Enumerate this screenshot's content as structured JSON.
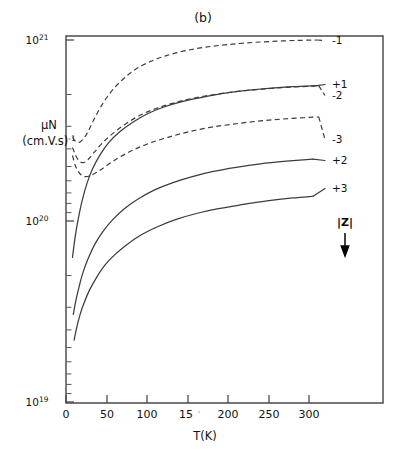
{
  "figure": {
    "panel_label": "(b)",
    "background_color": "#ffffff",
    "ink_color": "#3c3c3c"
  },
  "chart_data": {
    "type": "line",
    "title": "(b)",
    "xlabel": "T(K)",
    "ylabel": "μN (cm.V.s)⁻¹",
    "ylabel_line1": "μN",
    "ylabel_line2_base": "(cm.V.s)",
    "ylabel_line2_sup": "-1",
    "xlim": [
      0,
      350
    ],
    "ylim": [
      1e+19,
      1e+21
    ],
    "yscale": "log",
    "xscale": "linear",
    "grid": false,
    "legend_position": "right-inline",
    "xticks": [
      0,
      50,
      100,
      150,
      200,
      250,
      300
    ],
    "xtick_labels": [
      "0",
      "50",
      "100",
      "15",
      "200",
      "250",
      "300"
    ],
    "xtick_label_note": "the 150 tick label is degraded in the scan and reads as 15",
    "yticks": [
      1e+19,
      1e+20,
      1e+21
    ],
    "ytick_labels": [
      "10",
      "10",
      "10"
    ],
    "ytick_exponents": [
      "19",
      "20",
      "21"
    ],
    "annotations": [
      {
        "text": "|Z|",
        "meaning": "charge-state magnitude increases downward"
      }
    ],
    "series": [
      {
        "name": "-1",
        "label": "-1",
        "style": "dashed",
        "label_x": 332,
        "label_y": 44,
        "points": [
          [
            8,
            2.9e+20
          ],
          [
            12,
            2.75e+20
          ],
          [
            16,
            2.72e+20
          ],
          [
            20,
            2.8e+20
          ],
          [
            26,
            3.05e+20
          ],
          [
            34,
            3.6e+20
          ],
          [
            44,
            4.35e+20
          ],
          [
            56,
            5.2e+20
          ],
          [
            70,
            6.05e+20
          ],
          [
            86,
            6.9e+20
          ],
          [
            104,
            7.6e+20
          ],
          [
            124,
            8.2e+20
          ],
          [
            146,
            8.7e+20
          ],
          [
            170,
            9.1e+20
          ],
          [
            196,
            9.4e+20
          ],
          [
            224,
            9.65e+20
          ],
          [
            254,
            9.82e+20
          ],
          [
            286,
            9.95e+20
          ],
          [
            310,
            1e+21
          ]
        ]
      },
      {
        "name": "-2",
        "label": "-2",
        "style": "dashed",
        "label_x": 332,
        "label_y": 99,
        "points": [
          [
            8,
            2.55e+20
          ],
          [
            12,
            2.3e+20
          ],
          [
            16,
            2.15e+20
          ],
          [
            21,
            2.1e+20
          ],
          [
            27,
            2.18e+20
          ],
          [
            35,
            2.4e+20
          ],
          [
            45,
            2.7e+20
          ],
          [
            58,
            3.05e+20
          ],
          [
            74,
            3.45e+20
          ],
          [
            92,
            3.85e+20
          ],
          [
            112,
            4.2e+20
          ],
          [
            134,
            4.5e+20
          ],
          [
            158,
            4.78e+20
          ],
          [
            184,
            5e+20
          ],
          [
            212,
            5.2e+20
          ],
          [
            242,
            5.35e+20
          ],
          [
            272,
            5.48e+20
          ],
          [
            300,
            5.55e+20
          ],
          [
            312,
            5.6e+20
          ]
        ]
      },
      {
        "name": "-3",
        "label": "-3",
        "style": "dashed",
        "label_x": 332,
        "label_y": 143,
        "points": [
          [
            8,
            2.3e+20
          ],
          [
            12,
            2e+20
          ],
          [
            17,
            1.83e+20
          ],
          [
            23,
            1.76e+20
          ],
          [
            30,
            1.78e+20
          ],
          [
            40,
            1.88e+20
          ],
          [
            52,
            2.05e+20
          ],
          [
            66,
            2.25e+20
          ],
          [
            84,
            2.48e+20
          ],
          [
            104,
            2.7e+20
          ],
          [
            126,
            2.9e+20
          ],
          [
            150,
            3.1e+20
          ],
          [
            176,
            3.28e+20
          ],
          [
            204,
            3.42e+20
          ],
          [
            234,
            3.55e+20
          ],
          [
            264,
            3.65e+20
          ],
          [
            294,
            3.72e+20
          ],
          [
            312,
            3.76e+20
          ]
        ]
      },
      {
        "name": "+1",
        "label": "+1",
        "style": "solid",
        "label_x": 332,
        "label_y": 88,
        "points": [
          [
            8,
            6.3e+19
          ],
          [
            11,
            8e+19
          ],
          [
            15,
            1.02e+20
          ],
          [
            20,
            1.3e+20
          ],
          [
            26,
            1.62e+20
          ],
          [
            33,
            1.95e+20
          ],
          [
            42,
            2.32e+20
          ],
          [
            53,
            2.72e+20
          ],
          [
            66,
            3.1e+20
          ],
          [
            82,
            3.5e+20
          ],
          [
            100,
            3.9e+20
          ],
          [
            120,
            4.25e+20
          ],
          [
            142,
            4.55e+20
          ],
          [
            166,
            4.8e+20
          ],
          [
            192,
            5.05e+20
          ],
          [
            220,
            5.25e+20
          ],
          [
            250,
            5.4e+20
          ],
          [
            280,
            5.52e+20
          ],
          [
            310,
            5.6e+20
          ]
        ]
      },
      {
        "name": "+2",
        "label": "+2",
        "style": "solid",
        "label_x": 332,
        "label_y": 164,
        "points": [
          [
            9,
            3.05e+19
          ],
          [
            12,
            3.6e+19
          ],
          [
            16,
            4.3e+19
          ],
          [
            21,
            5.2e+19
          ],
          [
            28,
            6.3e+19
          ],
          [
            36,
            7.5e+19
          ],
          [
            46,
            8.8e+19
          ],
          [
            58,
            1.02e+20
          ],
          [
            72,
            1.17e+20
          ],
          [
            90,
            1.33e+20
          ],
          [
            110,
            1.49e+20
          ],
          [
            132,
            1.63e+20
          ],
          [
            156,
            1.76e+20
          ],
          [
            182,
            1.88e+20
          ],
          [
            210,
            1.98e+20
          ],
          [
            240,
            2.07e+20
          ],
          [
            272,
            2.14e+20
          ],
          [
            305,
            2.2e+20
          ]
        ]
      },
      {
        "name": "+3",
        "label": "+3",
        "style": "solid",
        "label_x": 332,
        "label_y": 192,
        "points": [
          [
            10,
            2.2e+19
          ],
          [
            13,
            2.55e+19
          ],
          [
            17,
            3e+19
          ],
          [
            22,
            3.5e+19
          ],
          [
            29,
            4.15e+19
          ],
          [
            38,
            4.9e+19
          ],
          [
            48,
            5.7e+19
          ],
          [
            60,
            6.5e+19
          ],
          [
            75,
            7.4e+19
          ],
          [
            93,
            8.4e+19
          ],
          [
            113,
            9.3e+19
          ],
          [
            136,
            1.02e+20
          ],
          [
            161,
            1.1e+20
          ],
          [
            188,
            1.17e+20
          ],
          [
            217,
            1.23e+20
          ],
          [
            248,
            1.29e+20
          ],
          [
            280,
            1.34e+20
          ],
          [
            305,
            1.37e+20
          ]
        ]
      }
    ]
  },
  "zmark": {
    "label": "|Z|",
    "x": 345,
    "y": 222
  }
}
